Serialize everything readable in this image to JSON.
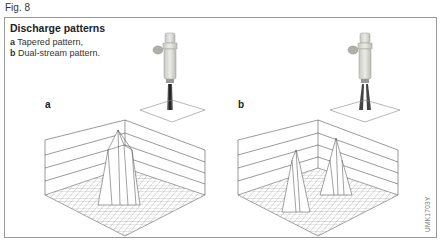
{
  "figure": {
    "label": "Fig. 8",
    "title": "Discharge patterns",
    "legend": [
      {
        "key": "a",
        "text": "Tapered pattern,"
      },
      {
        "key": "b",
        "text": "Dual-stream pattern."
      }
    ],
    "panels": [
      {
        "id": "a",
        "label": "a",
        "description": "Single tapered spray cone producing one central peak distribution"
      },
      {
        "id": "b",
        "label": "b",
        "description": "Dual-stream spray producing two separate peak distributions"
      }
    ],
    "code": "UMK1703Y"
  }
}
